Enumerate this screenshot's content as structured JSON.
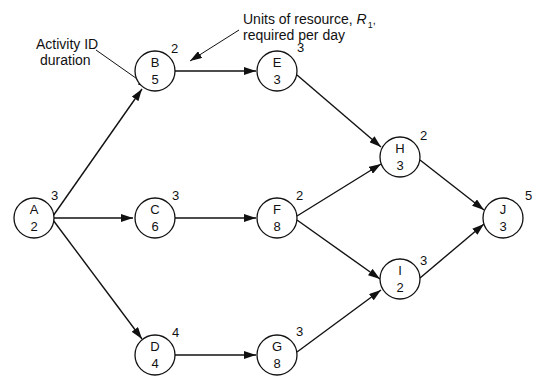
{
  "annotations": {
    "activity_label_line1": "Activity ID",
    "activity_label_line2": "duration",
    "resource_label_line1": "Units of resource, ",
    "resource_symbol": "R",
    "resource_subscript": "1",
    "resource_comma": ",",
    "resource_label_line2": "required per day"
  },
  "nodes": [
    {
      "id": "A",
      "duration": "2",
      "resource": "3"
    },
    {
      "id": "B",
      "duration": "5",
      "resource": "2"
    },
    {
      "id": "C",
      "duration": "6",
      "resource": "3"
    },
    {
      "id": "D",
      "duration": "4",
      "resource": "4"
    },
    {
      "id": "E",
      "duration": "3",
      "resource": "3"
    },
    {
      "id": "F",
      "duration": "8",
      "resource": "2"
    },
    {
      "id": "G",
      "duration": "8",
      "resource": "3"
    },
    {
      "id": "H",
      "duration": "3",
      "resource": "2"
    },
    {
      "id": "I",
      "duration": "2",
      "resource": "3"
    },
    {
      "id": "J",
      "duration": "3",
      "resource": "5"
    }
  ],
  "edges": [
    [
      "A",
      "B"
    ],
    [
      "A",
      "C"
    ],
    [
      "A",
      "D"
    ],
    [
      "B",
      "E"
    ],
    [
      "C",
      "F"
    ],
    [
      "D",
      "G"
    ],
    [
      "E",
      "H"
    ],
    [
      "F",
      "H"
    ],
    [
      "F",
      "I"
    ],
    [
      "G",
      "I"
    ],
    [
      "H",
      "J"
    ],
    [
      "I",
      "J"
    ]
  ]
}
